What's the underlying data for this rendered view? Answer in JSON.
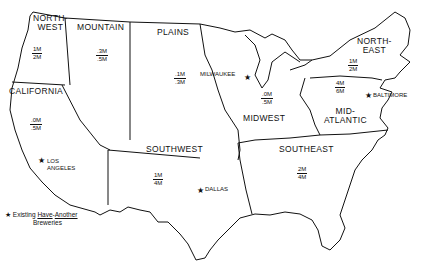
{
  "map": {
    "regions": [
      {
        "name": "NORTH-WEST",
        "label_lines": [
          "NORTH-",
          "WEST"
        ],
        "top": "1M",
        "bottom": "2M"
      },
      {
        "name": "MOUNTAIN",
        "label_lines": [
          "MOUNTAIN"
        ],
        "top": ".3M",
        "bottom": ".5M"
      },
      {
        "name": "PLAINS",
        "label_lines": [
          "PLAINS"
        ],
        "top": ".1M",
        "bottom": ".3M"
      },
      {
        "name": "NORTH-EAST",
        "label_lines": [
          "NORTH-",
          "EAST"
        ],
        "top": "1M",
        "bottom": "2M"
      },
      {
        "name": "CALIFORNIA",
        "label_lines": [
          "CALIFORNIA"
        ],
        "top": ".0M",
        "bottom": ".5M"
      },
      {
        "name": "MIDWEST",
        "label_lines": [
          "MIDWEST"
        ],
        "top": ".0M",
        "bottom": ".5M"
      },
      {
        "name": "MID-ATLANTIC",
        "label_lines": [
          "MID-",
          "ATLANTIC"
        ],
        "top": "4M",
        "bottom": "6M"
      },
      {
        "name": "SOUTHWEST",
        "label_lines": [
          "SOUTHWEST"
        ],
        "top": "1M",
        "bottom": "4M"
      },
      {
        "name": "SOUTHEAST",
        "label_lines": [
          "SOUTHEAST"
        ],
        "top": "2M",
        "bottom": "4M"
      }
    ],
    "cities": [
      {
        "name": "MILWAUKEE",
        "lines": [
          "MILWAUKEE"
        ]
      },
      {
        "name": "BALTIMORE",
        "lines": [
          "BALTIMORE"
        ]
      },
      {
        "name": "LOS ANGELES",
        "lines": [
          "LOS",
          "ANGELES"
        ]
      },
      {
        "name": "DALLAS",
        "lines": [
          "DALLAS"
        ]
      }
    ],
    "star_symbol": "★",
    "legend": {
      "symbol": "★",
      "text_1": "Existing ",
      "brand_1": "Have",
      "dash": "-",
      "brand_2": "Another",
      "text_2": "Breweries"
    }
  }
}
